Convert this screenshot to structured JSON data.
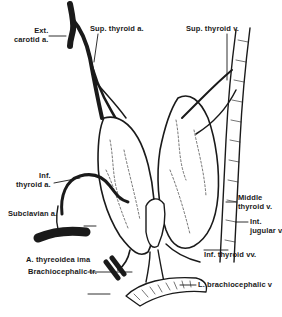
{
  "figure": {
    "type": "anatomical illustration",
    "labels": {
      "ext_carotid": "Ext.\ncarotid a.",
      "ext_carotid_line1": "Ext.",
      "ext_carotid_line2": "carotid a.",
      "sup_thyroid_a": "Sup. thyroid a.",
      "sup_thyroid_v": "Sup. thyroid v.",
      "inf_thyroid_a_line1": "Inf.",
      "inf_thyroid_a_line2": "thyroid a.",
      "subclavian": "Subclavian a.",
      "middle_thyroid_line1": "Middle",
      "middle_thyroid_line2": "thyroid v.",
      "int_jugular_line1": "Int.",
      "int_jugular_line2": "jugular v.",
      "thyreoidea_ima": "A. thyreoidea ima",
      "inf_thyroid_vv": "Inf. thyroid vv.",
      "brachiocephalic_tr": "Brachiocephalic tr.",
      "l_brachiocephalic": "L. brachiocephalic v"
    },
    "caption": "Figure ... (caption cut off)",
    "colors": {
      "ink": "#1a1a1a",
      "background": "#ffffff"
    }
  }
}
